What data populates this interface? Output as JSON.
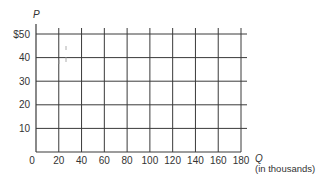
{
  "chart_data": {
    "type": "line",
    "title": "",
    "xlabel": "Q",
    "xlabel_unit": "(in thousands)",
    "ylabel": "P",
    "xlim": [
      0,
      180
    ],
    "ylim": [
      0,
      50
    ],
    "x_ticks": [
      0,
      20,
      40,
      60,
      80,
      100,
      120,
      140,
      160,
      180
    ],
    "x_tick_labels": [
      "0",
      "20",
      "40",
      "60",
      "80",
      "100",
      "120",
      "140",
      "160",
      "180"
    ],
    "y_ticks": [
      10,
      20,
      30,
      40,
      50
    ],
    "y_tick_labels": [
      "10",
      "20",
      "30",
      "40",
      "$50"
    ],
    "grid": true,
    "series": [],
    "colors": {
      "grid": "#3a3a3a",
      "text": "#333333",
      "background": "#ffffff"
    }
  }
}
